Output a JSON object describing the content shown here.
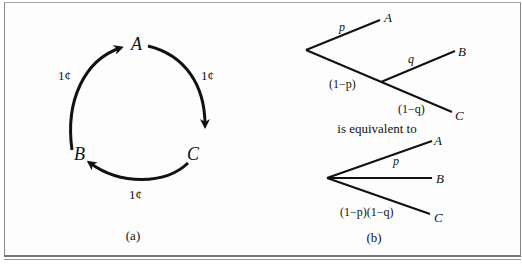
{
  "figure": {
    "panel_a": {
      "caption": "(a)",
      "nodes": {
        "A": "A",
        "B": "B",
        "C": "C"
      },
      "edges": [
        {
          "from": "A",
          "to": "C",
          "label": "1¢"
        },
        {
          "from": "C",
          "to": "B",
          "label": "1¢"
        },
        {
          "from": "B",
          "to": "A",
          "label": "1¢"
        }
      ]
    },
    "panel_b": {
      "caption": "(b)",
      "middle_text": "is equivalent to",
      "tree_top": {
        "labels": {
          "p": "p",
          "q": "q",
          "one_minus_p": "(1−p)",
          "one_minus_q": "(1−q)"
        },
        "leaves": {
          "A": "A",
          "B": "B",
          "C": "C"
        }
      },
      "tree_bottom": {
        "labels": {
          "p": "p",
          "product": "(1−p)(1−q)"
        },
        "leaves": {
          "A": "A",
          "B": "B",
          "C": "C"
        }
      }
    }
  }
}
